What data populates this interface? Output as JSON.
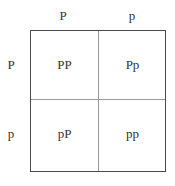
{
  "punnett_square": {
    "column_alleles": [
      "P",
      "p"
    ],
    "row_alleles": [
      "P",
      "p"
    ],
    "cells": [
      [
        "PP",
        "Pp"
      ],
      [
        "pP",
        "pp"
      ]
    ]
  },
  "colors": {
    "text": "#333333",
    "border": "#4a4a4a",
    "divider": "#9a9a9a"
  }
}
